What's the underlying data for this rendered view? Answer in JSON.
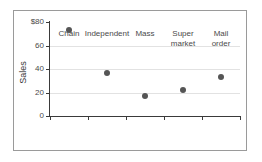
{
  "chart_data": {
    "type": "scatter",
    "title": "",
    "xlabel": "",
    "ylabel": "Sales",
    "categories": [
      "Chain",
      "Independent",
      "Mass",
      "Super market",
      "Mail order"
    ],
    "category_lines": [
      [
        "Chain"
      ],
      [
        "Independent"
      ],
      [
        "Mass"
      ],
      [
        "Super",
        "market"
      ],
      [
        "Mail",
        "order"
      ]
    ],
    "values": [
      73,
      36.5,
      17,
      22,
      33.5
    ],
    "ylim": [
      0,
      80
    ],
    "yticks": [
      0,
      20,
      40,
      60,
      80
    ],
    "ytick_labels": [
      "0",
      "20",
      "40",
      "60",
      "$80"
    ],
    "grid": "horizontal",
    "legend": "none",
    "marker_color": "#555555",
    "gridline_color": "#e2e2e2",
    "axis_color": "#3a3a3a",
    "frame_color": "#9a9a9a",
    "background_color": "#ffffff"
  }
}
